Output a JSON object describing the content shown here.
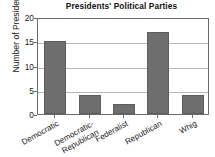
{
  "chart_data": {
    "type": "bar",
    "title": "Presidents' Political Parties",
    "xlabel": "",
    "ylabel": "Number of Presidents",
    "categories": [
      "Democratic",
      "Democratic-Republican",
      "Federalist",
      "Republican",
      "Whig"
    ],
    "category_lines": [
      [
        "Democratic"
      ],
      [
        "Democratic-",
        "Republican"
      ],
      [
        "Federalist"
      ],
      [
        "Republican"
      ],
      [
        "Whig"
      ]
    ],
    "values": [
      15,
      4,
      2,
      17,
      4
    ],
    "ylim": [
      0,
      20
    ],
    "ytick_labels": [
      "0",
      "5",
      "10",
      "15",
      "20"
    ],
    "ytick_values": [
      0,
      5,
      10,
      15,
      20
    ],
    "grid": "horizontal",
    "legend": "none",
    "bar_color": "#6e6e6e",
    "frame_color": "#6a6a6a",
    "grid_color": "#b8b8b8",
    "background_color": "#ffffff"
  }
}
